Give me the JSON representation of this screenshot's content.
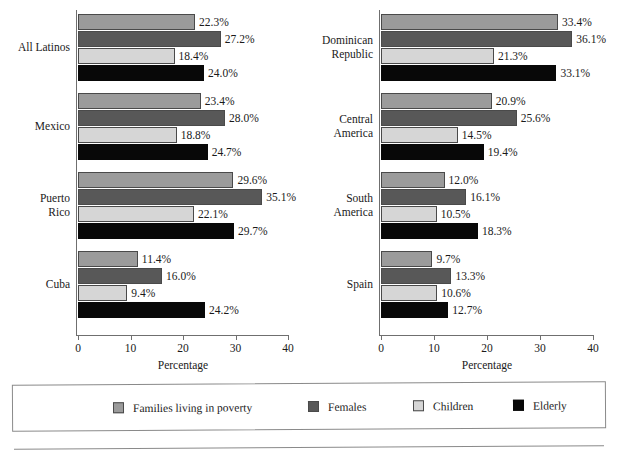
{
  "figure": {
    "cut_off_header": "",
    "axis_title": "Percentage",
    "axis_ticks": [
      0,
      10,
      20,
      30,
      40
    ],
    "axis_min": 0,
    "axis_max": 40
  },
  "legend": {
    "items": [
      {
        "label": "Families living in poverty",
        "color": "#9b9b9b",
        "key": "families-living-in-poverty"
      },
      {
        "label": "Females",
        "color": "#585858",
        "key": "females"
      },
      {
        "label": "Children",
        "color": "#d6d6d6",
        "key": "children"
      },
      {
        "label": "Elderly",
        "color": "#080808",
        "key": "elderly"
      }
    ]
  },
  "chart_data": {
    "type": "bar",
    "orientation": "horizontal",
    "title": "",
    "xlabel": "Percentage",
    "ylabel": "",
    "xlim": [
      0,
      40
    ],
    "xticks": [
      0,
      10,
      20,
      30,
      40
    ],
    "grid": false,
    "legend_position": "bottom",
    "value_suffix": "%",
    "series": [
      {
        "name": "Families living in poverty",
        "color": "#9b9b9b"
      },
      {
        "name": "Females",
        "color": "#585858"
      },
      {
        "name": "Children",
        "color": "#d6d6d6"
      },
      {
        "name": "Elderly",
        "color": "#080808"
      }
    ],
    "panels": [
      {
        "panel": "left",
        "categories": [
          "All Latinos",
          "Mexico",
          "Puerto\nRico",
          "Cuba"
        ],
        "values": [
          [
            22.3,
            27.2,
            18.4,
            24.0
          ],
          [
            23.4,
            28.0,
            18.8,
            24.7
          ],
          [
            29.6,
            35.1,
            22.1,
            29.7
          ],
          [
            11.4,
            16.0,
            9.4,
            24.2
          ]
        ],
        "labels": [
          [
            "22.3%",
            "27.2%",
            "18.4%",
            "24.0%"
          ],
          [
            "23.4%",
            "28.0%",
            "18.8%",
            "24.7%"
          ],
          [
            "29.6%",
            "35.1%",
            "22.1%",
            "29.7%"
          ],
          [
            "11.4%",
            "16.0%",
            "9.4%",
            "24.2%"
          ]
        ]
      },
      {
        "panel": "right",
        "categories": [
          "Dominican\nRepublic",
          "Central\nAmerica",
          "South\nAmerica",
          "Spain"
        ],
        "values": [
          [
            33.4,
            36.1,
            21.3,
            33.1
          ],
          [
            20.9,
            25.6,
            14.5,
            19.4
          ],
          [
            12.0,
            16.1,
            10.5,
            18.3
          ],
          [
            9.7,
            13.3,
            10.6,
            12.7
          ]
        ],
        "labels": [
          [
            "33.4%",
            "36.1%",
            "21.3%",
            "33.1%"
          ],
          [
            "20.9%",
            "25.6%",
            "14.5%",
            "19.4%"
          ],
          [
            "12.0%",
            "16.1%",
            "10.5%",
            "18.3%"
          ],
          [
            "9.7%",
            "13.3%",
            "10.6%",
            "12.7%"
          ]
        ]
      }
    ]
  }
}
